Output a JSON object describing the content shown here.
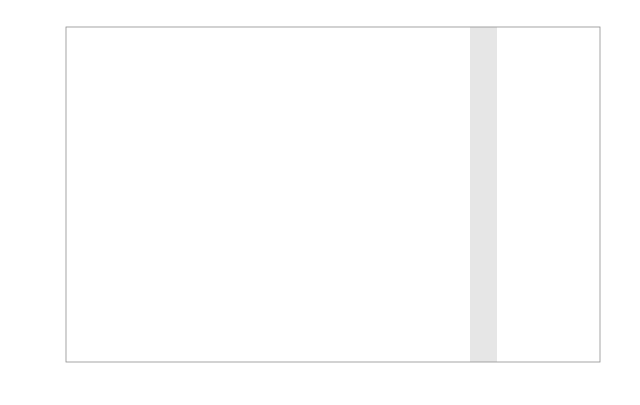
{
  "figure": {
    "left_axis_title": "VALUES OF P",
    "top_axis_unit_mark": "x",
    "right_axis_unit_mark": "x",
    "bottom_axis_unit_mark": "x"
  },
  "chart_data": {
    "type": "line",
    "title": "",
    "subtitle": "",
    "xlabel": "",
    "ylabel": "VALUES OF P",
    "grid": true,
    "legend_position": "none",
    "y_axis": {
      "name": "VALUES OF P",
      "scale": "normal-probability (probit)",
      "tick_labels": [
        "·000001",
        "·00001",
        "·0001",
        "·001",
        "·01",
        "·1",
        "·2",
        "·3",
        "·4",
        "·5",
        "·6",
        "·7",
        "·8",
        "·9",
        "·99",
        "·999",
        "·9999",
        "·99999",
        "·999999"
      ],
      "tick_values": [
        1e-06,
        1e-05,
        0.0001,
        0.001,
        0.01,
        0.1,
        0.2,
        0.3,
        0.4,
        0.5,
        0.6,
        0.7,
        0.8,
        0.9,
        0.99,
        0.999,
        0.9999,
        0.99999,
        0.999999
      ],
      "tick_y_px": [
        32,
        55,
        78,
        110,
        142,
        178,
        190,
        200,
        209,
        217,
        225,
        233,
        243,
        255,
        278,
        300,
        320,
        340,
        361
      ]
    },
    "x_axis_bottom": {
      "scale": "logarithmic",
      "tick_labels": [
        "0·1",
        "0·2",
        "0·3",
        "0·4",
        "0·5",
        "0·6",
        "0·8",
        "1",
        "2",
        "3",
        "4",
        "5",
        "6",
        "7",
        "8",
        "9",
        "10",
        "20",
        "30",
        "40",
        "50",
        "60",
        "80",
        "100"
      ],
      "tick_values": [
        0.1,
        0.2,
        0.3,
        0.4,
        0.5,
        0.6,
        0.8,
        1,
        2,
        3,
        4,
        5,
        6,
        7,
        8,
        9,
        10,
        20,
        30,
        40,
        50,
        60,
        80,
        100
      ],
      "tick_x_px": [
        66,
        113,
        141,
        161,
        176,
        189,
        210,
        228,
        275,
        302,
        322,
        337,
        350,
        361,
        371,
        379,
        386,
        433,
        461,
        481,
        495,
        509,
        530,
        548
      ]
    },
    "x_axis_bottom_secondary": {
      "scale": "logarithmic",
      "tick_labels": [
        "·1",
        "5",
        "10",
        "20",
        "30",
        "40",
        "50"
      ],
      "tick_values": [
        0.1,
        5,
        10,
        20,
        30,
        40,
        50
      ],
      "tick_x_px": [
        41,
        412,
        459,
        505,
        533,
        552,
        568
      ]
    },
    "x_axis_top": {
      "scale": "logarithmic",
      "tick_labels": [
        "·5",
        "10",
        "20",
        "30",
        "40",
        "50",
        "75",
        "100",
        "125",
        "150"
      ],
      "tick_values": [
        0.5,
        10,
        20,
        30,
        40,
        50,
        75,
        100,
        125,
        150
      ],
      "tick_x_px": [
        99,
        255,
        349,
        404,
        443,
        473,
        525,
        557,
        583,
        606
      ]
    },
    "y_axis_right": {
      "scale": "linear",
      "tick_labels": [
        "150",
        "140",
        "130",
        "120",
        "110",
        "100",
        "90",
        "80",
        "70",
        "60"
      ],
      "tick_values": [
        150,
        140,
        130,
        120,
        110,
        100,
        90,
        80,
        70,
        60
      ],
      "tick_y_px": [
        48,
        80,
        113,
        145,
        177,
        210,
        243,
        275,
        307,
        340
      ]
    },
    "series": [
      {
        "name": "curve-p-000001",
        "start_p": "·000001"
      },
      {
        "name": "curve-p-00001",
        "start_p": "·00001"
      },
      {
        "name": "curve-p-0001",
        "start_p": "·0001"
      },
      {
        "name": "curve-p-001",
        "start_p": "·01"
      },
      {
        "name": "curve-p-01",
        "start_p": "·1"
      }
    ],
    "shaded_band": {
      "x_start_px": 470,
      "x_end_px": 497,
      "label": "50-60"
    }
  },
  "colors": {
    "background": "#ffffff",
    "grid_vertical": "#b9b9b9",
    "grid_horizontal": "#b4b4b4",
    "curve": "#545454",
    "fan_line": "#5a5a5a",
    "text": "#3c3c3c",
    "shade": "#d9d9d9"
  }
}
